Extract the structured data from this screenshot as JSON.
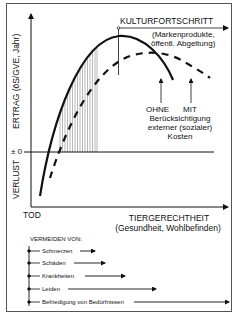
{
  "diagram": {
    "y_axis": {
      "upper_label": "ERTRAG (öS/GVE, Jahr)",
      "lower_label": "VERLUST",
      "zero_label": "± 0"
    },
    "x_axis": {
      "origin_label": "TOD",
      "title": "TIERGERECHTHEIT",
      "subtitle": "(Gesundheit, Wohlbefinden)"
    },
    "culture_axis": {
      "title": "KULTURFORTSCHRITT",
      "subtitle_line1": "(Markenprodukte,",
      "subtitle_line2": "öffentl. Abgeltung)"
    },
    "curve_annotations": {
      "ohne": "OHNE",
      "mit": "MIT",
      "line2": "Berücksichtigung",
      "line3": "externer (sozialer)",
      "line4": "Kosten"
    },
    "curves": [
      {
        "name": "ohne-externe-kosten",
        "style": "solid"
      },
      {
        "name": "mit-externen-kosten",
        "style": "dashed"
      }
    ],
    "avoidance": {
      "title": "VERMEIDEN VON:",
      "items": [
        {
          "label": "Schmerzen"
        },
        {
          "label": "Schäden"
        },
        {
          "label": "Krankheiten"
        },
        {
          "label": "Leiden"
        },
        {
          "label": "Befriedigung von Bedürfnissen"
        }
      ]
    },
    "colors": {
      "line": "#111111",
      "border": "#555555",
      "hatch": "#888888",
      "background": "#ffffff"
    }
  }
}
